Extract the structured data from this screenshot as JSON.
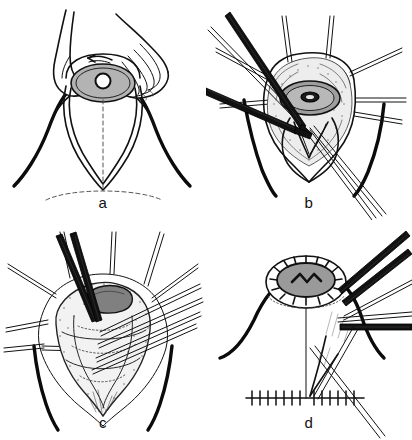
{
  "figure": {
    "type": "line-art medical illustration",
    "background_color": "#ffffff",
    "ink_color": "#111111",
    "panel_count": 4,
    "panels": [
      {
        "id": "a",
        "label": "a",
        "caption": "Two hands compress the breast; teardrop skin-marking pattern drawn around the nipple-areola complex with dashed vertical midline and dashed inframammary fold.",
        "elements": [
          "left-hand",
          "right-hand",
          "breast-contour",
          "areola-ellipse",
          "nipple-circle",
          "teardrop-marking",
          "dashed-midline",
          "dashed-inframammary-fold",
          "direction-arrow"
        ],
        "colors": {
          "areola_fill": "#b3b3b3",
          "nipple_fill": "#ffffff",
          "outline": "#111111",
          "dashed_guide": "#555555"
        }
      },
      {
        "id": "b",
        "label": "b",
        "caption": "Skin hooks retract the wound edges radially; a scalpel and forceps dissect the de-epithelialized dermal flap beneath the nipple-areola complex.",
        "elements": [
          "skin-hook-retractors",
          "scalpel-blade",
          "forceps-upper",
          "forceps-lower",
          "areola-ellipse",
          "nipple-circle",
          "exposed-gland",
          "dermal-flap",
          "wound-edge"
        ],
        "colors": {
          "areola_fill": "#9e9e9e",
          "nipple_fill": "#1a1a1a",
          "instrument_fill": "#111111",
          "gland_tone": "#e8e8e8"
        }
      },
      {
        "id": "c",
        "label": "c",
        "caption": "Wide exposure of the glandular cone held by multiple retractors; resection scissors are applied to the superior glandular pedicle marked in dark gray.",
        "elements": [
          "skin-hook-retractors",
          "scissors",
          "forceps-bundle",
          "glandular-cone",
          "resection-zone",
          "contour-lines",
          "stipple-texture"
        ],
        "colors": {
          "resection_fill": "#808080",
          "gland_tone": "#efefef",
          "instrument_fill": "#111111"
        }
      },
      {
        "id": "d",
        "label": "d",
        "caption": "Lateral view of the closed reduction: the nipple-areola complex is sutured circumferentially, a vertical limb descends to a transverse inframammary suture line; forceps hold the tissue.",
        "elements": [
          "breast-profile",
          "areola-disc",
          "circumferential-sutures",
          "zigzag-marking",
          "vertical-limb",
          "inframammary-suture-line",
          "forceps-bundle",
          "scissors"
        ],
        "colors": {
          "areola_fill": "#9a9a9a",
          "suture_color": "#111111",
          "instrument_fill": "#111111"
        }
      }
    ]
  }
}
